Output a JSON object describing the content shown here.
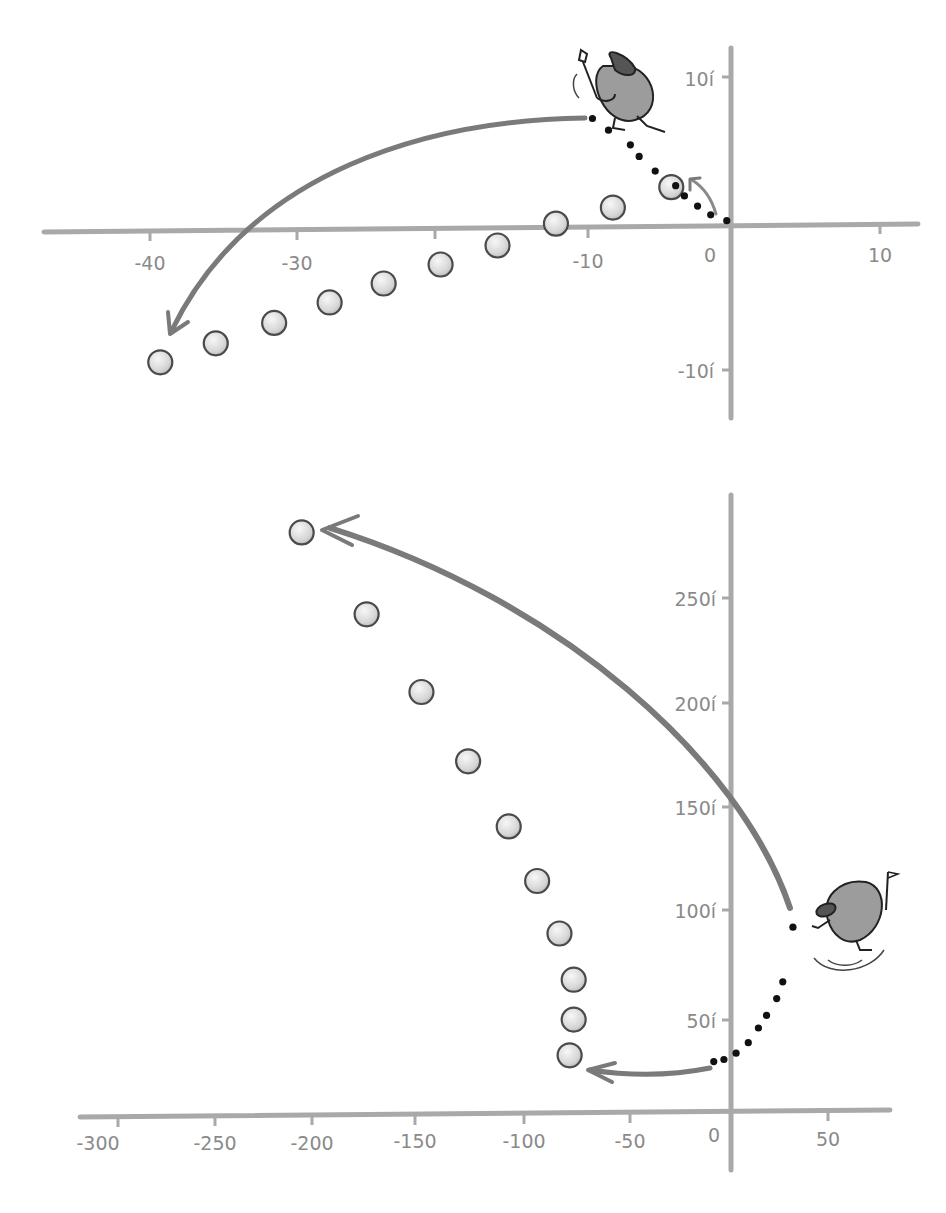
{
  "chart_data": [
    {
      "type": "scatter",
      "title": "",
      "xlabel": "",
      "ylabel": "",
      "x_ticks": [
        "-40",
        "-30",
        "-10",
        "0",
        "10"
      ],
      "y_ticks": [
        "10í",
        "-10í"
      ],
      "xlim": [
        -44,
        12
      ],
      "ylim": [
        -13,
        13
      ],
      "grid": false,
      "annotations": [
        "cartoon golfer near (-8, 8)",
        "curved arrow from golfer toward ball at (-38, -9)",
        "small arrow near origin",
        "dotted trajectory from (-9, 7.5) to (0, 0.5)"
      ],
      "series": [
        {
          "name": "balls",
          "x": [
            -38.2,
            -34.4,
            -30.4,
            -26.6,
            -22.9,
            -19.0,
            -15.1,
            -11.1,
            -7.2,
            -3.2
          ],
          "y": [
            -9.2,
            -7.9,
            -6.5,
            -5.1,
            -3.8,
            -2.5,
            -1.2,
            0.3,
            1.4,
            2.8
          ]
        },
        {
          "name": "dotted-path",
          "x": [
            -8.6,
            -7.5,
            -6.0,
            -5.4,
            -4.3,
            -2.9,
            -2.3,
            -1.4,
            -0.5,
            0.6
          ],
          "y": [
            7.5,
            6.7,
            5.7,
            4.9,
            3.9,
            2.9,
            2.2,
            1.5,
            0.9,
            0.5
          ]
        }
      ]
    },
    {
      "type": "scatter",
      "title": "",
      "xlabel": "",
      "ylabel": "",
      "x_ticks": [
        "-300",
        "-250",
        "-200",
        "-150",
        "-100",
        "-50",
        "0",
        "50"
      ],
      "y_ticks": [
        "50í",
        "100í",
        "150í",
        "200í",
        "250í"
      ],
      "xlim": [
        -320,
        80
      ],
      "ylim": [
        -20,
        300
      ],
      "grid": false,
      "annotations": [
        "cartoon golfer near (55, 95)",
        "long curved arrow from (30, 100) to ball at (-211, 276)",
        "short arrow from (-10, 20) to ball at (-79, 27)",
        "dotted trajectory from (-8, 22) to (33, 90)"
      ],
      "series": [
        {
          "name": "balls",
          "x": [
            -211,
            -179,
            -152,
            -129,
            -109,
            -95,
            -84,
            -77,
            -77,
            -79
          ],
          "y": [
            276,
            237,
            200,
            167,
            136,
            110,
            85,
            63,
            44,
            27
          ]
        },
        {
          "name": "dotted-path",
          "x": [
            -8,
            -3,
            3,
            9,
            14,
            18,
            23,
            26,
            31
          ],
          "y": [
            24,
            25,
            28,
            33,
            40,
            46,
            54,
            62,
            88
          ]
        }
      ]
    }
  ],
  "top": {
    "x_labels": [
      {
        "text": "-40",
        "x": 150
      },
      {
        "text": "-30",
        "x": 297
      },
      {
        "text": "-10",
        "x": 588
      },
      {
        "text": "0",
        "x": 710
      },
      {
        "text": "10",
        "x": 880
      }
    ],
    "y_labels": [
      {
        "text": "10í",
        "y": 80
      },
      {
        "text": "-10í",
        "y": 372
      }
    ]
  },
  "bottom": {
    "x_labels": [
      {
        "text": "-300",
        "x": 98
      },
      {
        "text": "-250",
        "x": 215
      },
      {
        "text": "-200",
        "x": 312
      },
      {
        "text": "-150",
        "x": 415
      },
      {
        "text": "-100",
        "x": 524
      },
      {
        "text": "-50",
        "x": 630
      },
      {
        "text": "0",
        "x": 714
      },
      {
        "text": "50",
        "x": 828
      }
    ],
    "y_labels": [
      {
        "text": "250í",
        "y": 600
      },
      {
        "text": "200í",
        "y": 705
      },
      {
        "text": "150í",
        "y": 809
      },
      {
        "text": "100í",
        "y": 912
      },
      {
        "text": "50í",
        "y": 1022
      }
    ]
  }
}
